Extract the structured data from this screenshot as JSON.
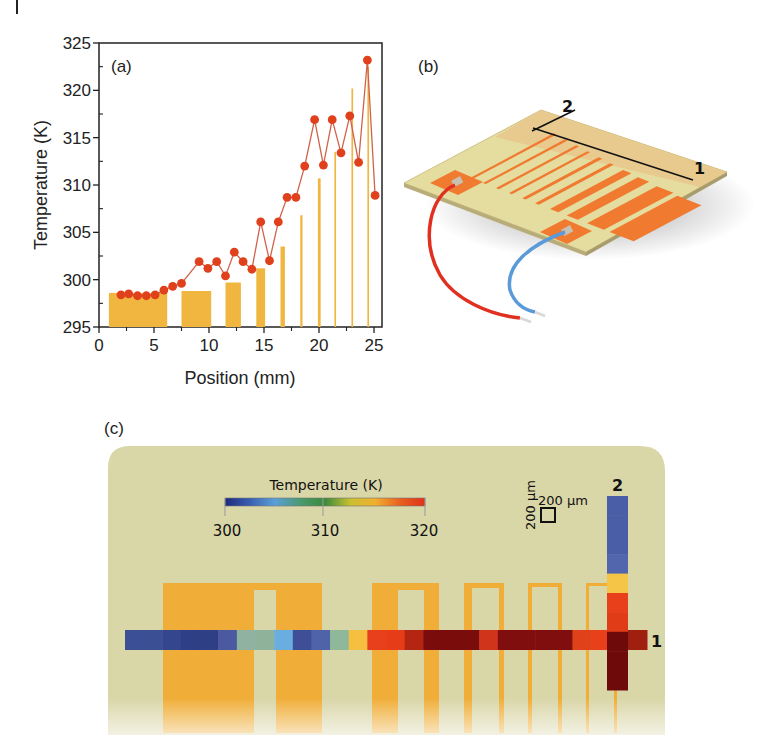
{
  "figure": {
    "panel_a_label": "(a)",
    "panel_b_label": "(b)",
    "panel_c_label": "(c)"
  },
  "chart_data": {
    "type": "scatter",
    "title": "",
    "panel": "(a)",
    "xlabel": "Position (mm)",
    "ylabel": "Temperature (K)",
    "xlim": [
      0,
      25
    ],
    "ylim": [
      295,
      325
    ],
    "xticks": [
      0,
      5,
      10,
      15,
      20,
      25
    ],
    "yticks": [
      295,
      300,
      305,
      310,
      315,
      320,
      325
    ],
    "grid": false,
    "series": [
      {
        "name": "Measured temperature",
        "style": "line+markers",
        "color": "#e0401c",
        "line_color": "#d0624a",
        "x": [
          2.0,
          2.7,
          3.5,
          4.3,
          5.1,
          5.9,
          6.7,
          7.5,
          9.1,
          9.9,
          10.7,
          11.5,
          12.3,
          13.1,
          13.9,
          14.7,
          15.5,
          16.3,
          17.1,
          17.9,
          18.7,
          19.6,
          20.4,
          21.2,
          22.0,
          22.8,
          23.6,
          24.4,
          25.1
        ],
        "y": [
          298.4,
          298.5,
          298.3,
          298.3,
          298.4,
          298.9,
          299.3,
          299.6,
          301.9,
          301.2,
          301.9,
          300.4,
          302.9,
          301.9,
          301.1,
          306.1,
          302.0,
          306.1,
          308.7,
          308.7,
          312.0,
          316.9,
          312.1,
          316.9,
          313.4,
          317.3,
          312.4,
          323.2,
          308.9
        ]
      },
      {
        "name": "Heater conductor strips",
        "style": "bars",
        "color": "#f0b640",
        "bars": [
          {
            "x0": 0.9,
            "x1": 6.2,
            "top": 298.6
          },
          {
            "x0": 7.5,
            "x1": 10.2,
            "top": 298.8
          },
          {
            "x0": 11.5,
            "x1": 12.9,
            "top": 299.7
          },
          {
            "x0": 14.3,
            "x1": 15.1,
            "top": 301.2
          },
          {
            "x0": 16.5,
            "x1": 16.9,
            "top": 303.5
          },
          {
            "x0": 18.3,
            "x1": 18.5,
            "top": 306.8
          },
          {
            "x0": 19.9,
            "x1": 20.15,
            "top": 310.7
          },
          {
            "x0": 21.4,
            "x1": 21.55,
            "top": 313.5
          },
          {
            "x0": 22.95,
            "x1": 23.1,
            "top": 320.2
          },
          {
            "x0": 24.4,
            "x1": 24.55,
            "top": 322.5
          }
        ]
      }
    ]
  },
  "panel_b": {
    "line_labels": [
      "2",
      "1"
    ],
    "description": "Serpentine heater device with red and blue lead wires"
  },
  "panel_c": {
    "colorbar": {
      "title": "Temperature (K)",
      "ticks": [
        "300",
        "310",
        "320"
      ],
      "range": [
        300,
        320
      ],
      "stops": [
        "#1c2a7a",
        "#3a5fb0",
        "#5aa0d8",
        "#4a9a70",
        "#3a8a3a",
        "#c8c030",
        "#f0b030",
        "#e86020",
        "#e03018"
      ]
    },
    "scale_bar": {
      "horizontal_label": "200 µm",
      "vertical_label": "200 µm"
    },
    "line_labels": {
      "line1": "1",
      "line2": "2"
    },
    "line1_cells": [
      "#3b4f95",
      "#3b4f95",
      "#34468e",
      "#2e3f85",
      "#2e3f85",
      "#4b5aa0",
      "#8fb3a0",
      "#8fb39a",
      "#6aaee0",
      "#3f4f97",
      "#4e63a8",
      "#8fb89a",
      "#f5c040",
      "#e8401c",
      "#e63c18",
      "#b52612",
      "#7a0c0c",
      "#7a0c0c",
      "#7a0c0c",
      "#d0341a",
      "#800e0e",
      "#800e0e",
      "#800e0e",
      "#800e0e",
      "#e0401a",
      "#e8401a",
      "#6e0808",
      "#a0200f"
    ],
    "line2_cells": [
      "#4a5ea8",
      "#4a5ea8",
      "#4a5ea8",
      "#5166ad",
      "#f5c548",
      "#e8401a",
      "#e03c18",
      "#6e0a0a",
      "#6e0a0a",
      "#6e0a0a"
    ]
  }
}
